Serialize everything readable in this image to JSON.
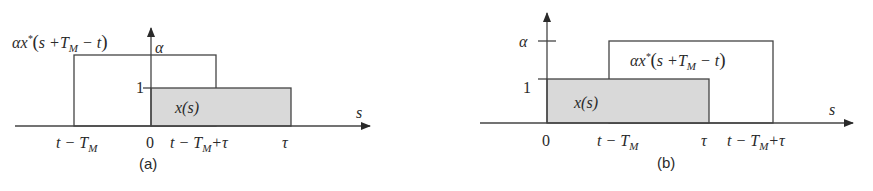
{
  "figure": {
    "panels": [
      {
        "id": "a",
        "caption": "(a)",
        "axis_x_label": "s",
        "axis_y_label": "α",
        "y_tick_1": "1",
        "shaded_label": "x(s)",
        "outline_label": {
          "alpha": "α",
          "x": "x",
          "star": "*",
          "open": "(",
          "s_plus": "s +",
          "T": "T",
          "M": "M",
          "minus_t": " − t",
          "close": ")"
        },
        "x_ticks": {
          "t_minus_TM": {
            "t": "t − T",
            "sub": "M"
          },
          "zero": "0",
          "t_minus_TM_plus_tau": {
            "t": "t − T",
            "sub": "M",
            "tail": "+τ"
          },
          "tau": "τ"
        }
      },
      {
        "id": "b",
        "caption": "(b)",
        "axis_x_label": "s",
        "axis_y_label": "α",
        "y_tick_1": "1",
        "shaded_label": "x(s)",
        "outline_label": {
          "alpha": "α",
          "x": "x",
          "star": "*",
          "open": "(",
          "s_plus": "s +",
          "T": "T",
          "M": "M",
          "minus_t": " − t",
          "close": ")"
        },
        "x_ticks": {
          "zero": "0",
          "t_minus_TM": {
            "t": "t − T",
            "sub": "M"
          },
          "tau": "τ",
          "t_minus_TM_plus_tau": {
            "t": "t − T",
            "sub": "M",
            "tail": "+τ"
          }
        }
      }
    ],
    "colors": {
      "shade": "#d9d9d9",
      "line": "#444444",
      "text": "#2a2a2a"
    }
  }
}
